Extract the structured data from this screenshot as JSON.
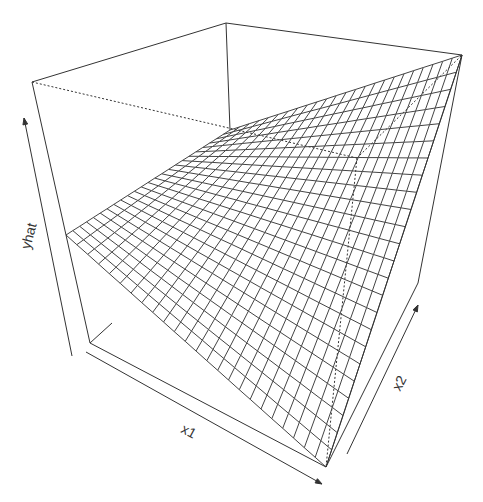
{
  "chart_data": {
    "type": "surface",
    "title": "",
    "xlabel": "x1",
    "ylabel": "x2",
    "zlabel": "yhat",
    "grid_resolution": [
      24,
      24
    ],
    "view": "perspective box, theta/phi rotated; wireframe surface (persp-style)",
    "surface_description": "Wireframe fitted-response surface yhat over x1, x2 with interaction (saddle-like twist); highest at x1 max / x2 max corner (top-right), lowest near front corner",
    "box_corners_px": {
      "top_left": [
        32,
        82
      ],
      "top_back": [
        226,
        23
      ],
      "top_right": [
        462,
        55
      ],
      "bottom_left": [
        90,
        343
      ],
      "bottom_front": [
        326,
        467
      ],
      "bottom_right": [
        418,
        283
      ],
      "hidden_back_bottom": [
        357,
        158
      ]
    },
    "surface_corners_px": {
      "left": [
        66,
        235
      ],
      "back": [
        230,
        130
      ],
      "top_right": [
        462,
        55
      ],
      "front": [
        326,
        467
      ]
    },
    "axes": {
      "x1": {
        "label": "x1",
        "arrow_from": [
          86,
          352
        ],
        "arrow_to": [
          322,
          484
        ]
      },
      "x2": {
        "label": "x2",
        "arrow_from": [
          347,
          454
        ],
        "arrow_to": [
          418,
          305
        ]
      },
      "yhat": {
        "label": "yhat",
        "arrow_from": [
          72,
          356
        ],
        "arrow_to": [
          24,
          118
        ]
      }
    }
  },
  "colors": {
    "line": "#333333",
    "mesh": "#444444",
    "background": "#ffffff"
  }
}
